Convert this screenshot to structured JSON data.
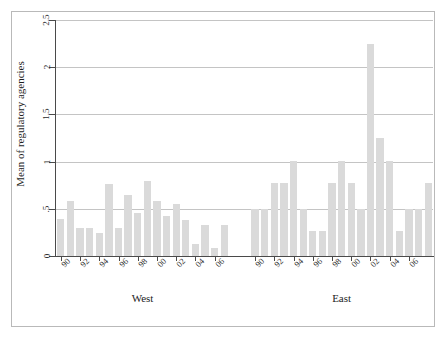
{
  "chart_data": {
    "type": "bar",
    "title": "",
    "subtitle": "",
    "xlabel": "",
    "ylabel": "Mean of regulatory agencies",
    "ylim": [
      0,
      2.5
    ],
    "yticks": [
      0,
      0.5,
      1,
      1.5,
      2,
      2.5
    ],
    "ytick_labels": [
      "0",
      ".5",
      "1",
      "1.5",
      "2",
      "2.5"
    ],
    "grid": true,
    "legend": null,
    "bar_color": "#dadada",
    "axis_color": "#4a4a4a",
    "grid_color": "#c4c4c4",
    "groups": [
      {
        "name": "West",
        "categories": [
          "90",
          "91",
          "92",
          "93",
          "94",
          "95",
          "96",
          "97",
          "98",
          "99",
          "00",
          "01",
          "02",
          "03",
          "04",
          "05",
          "06"
        ],
        "tick_labels": [
          "90",
          "92",
          "94",
          "96",
          "98",
          "00",
          "02",
          "04",
          "06"
        ],
        "values": [
          0.39,
          0.58,
          0.3,
          0.3,
          0.24,
          0.76,
          0.3,
          0.65,
          0.46,
          0.79,
          0.58,
          0.42,
          0.55,
          0.38,
          0.13,
          0.33,
          0.08,
          0.33
        ]
      },
      {
        "name": "East",
        "categories": [
          "90",
          "91",
          "92",
          "93",
          "94",
          "95",
          "96",
          "97",
          "98",
          "99",
          "00",
          "01",
          "02",
          "03",
          "04",
          "05",
          "06"
        ],
        "tick_labels": [
          "90",
          "92",
          "94",
          "96",
          "98",
          "00",
          "02",
          "04",
          "06"
        ],
        "values": [
          0.5,
          0.5,
          0.77,
          0.77,
          1.01,
          0.5,
          0.26,
          0.26,
          0.77,
          1.01,
          0.77,
          0.5,
          2.25,
          1.25,
          1.01,
          0.26,
          0.5,
          0.5,
          0.77
        ]
      }
    ]
  },
  "axis": {
    "ylabel": "Mean of regulatory agencies"
  },
  "group_labels": {
    "west": "West",
    "east": "East"
  }
}
